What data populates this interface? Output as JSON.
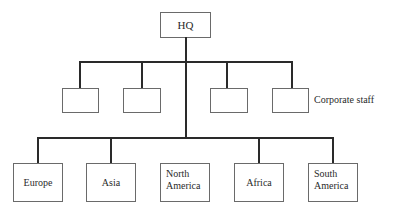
{
  "diagram": {
    "root": {
      "label": "HQ"
    },
    "staff": {
      "label": "Corporate staff",
      "boxes": [
        {
          "label": ""
        },
        {
          "label": ""
        },
        {
          "label": ""
        },
        {
          "label": ""
        }
      ]
    },
    "regions": [
      {
        "label": "Europe"
      },
      {
        "label": "Asia"
      },
      {
        "label": "North\nAmerica"
      },
      {
        "label": "Africa"
      },
      {
        "label": "South\nAmerica"
      }
    ],
    "colors": {
      "line": "#2a2a2a",
      "box_border": "#6a6a6a",
      "background": "#ffffff"
    }
  }
}
